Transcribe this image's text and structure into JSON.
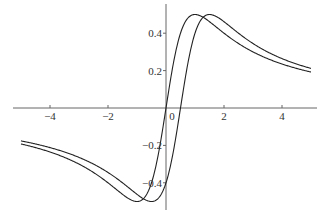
{
  "chart_data": {
    "type": "line",
    "title": "",
    "xlabel": "",
    "ylabel": "",
    "xlim": [
      -5,
      5
    ],
    "ylim": [
      -0.5,
      0.5
    ],
    "grid": false,
    "legend": null,
    "x_ticks": [
      -4,
      -2,
      0,
      2,
      4
    ],
    "x_tick_labels": [
      "−4",
      "−2",
      "0",
      "2",
      "4"
    ],
    "y_ticks": [
      -0.4,
      -0.2,
      0.2,
      0.4
    ],
    "y_tick_labels": [
      "−0.4",
      "−0.2",
      "0.2",
      "0.4"
    ],
    "series": [
      {
        "name": "curve-1",
        "formula": "x/(1+x^2)",
        "x": [
          -5,
          -4,
          -3,
          -2,
          -1.5,
          -1,
          -0.5,
          0,
          0.5,
          1,
          1.5,
          2,
          3,
          4,
          5
        ],
        "values": [
          -0.192,
          -0.235,
          -0.3,
          -0.4,
          -0.462,
          -0.5,
          -0.4,
          0,
          0.4,
          0.5,
          0.462,
          0.4,
          0.3,
          0.235,
          0.192
        ]
      },
      {
        "name": "curve-2",
        "formula": "(x-0.5)/(1+(x-0.5)^2)",
        "x": [
          -5,
          -4,
          -3,
          -2,
          -1,
          -0.5,
          0,
          0.5,
          1,
          1.5,
          2,
          2.5,
          3,
          4,
          5
        ],
        "values": [
          -0.176,
          -0.213,
          -0.268,
          -0.345,
          -0.462,
          -0.5,
          -0.4,
          0,
          0.4,
          0.5,
          0.462,
          0.4,
          0.345,
          0.268,
          0.212
        ]
      }
    ]
  },
  "layout": {
    "x0_px": 166,
    "y0_px": 108,
    "x_scale": 29,
    "y_scale": 187,
    "plot_left": 20,
    "plot_right": 311
  },
  "colors": {
    "axis": "#666666",
    "curve": "#222222",
    "label": "#333333"
  }
}
